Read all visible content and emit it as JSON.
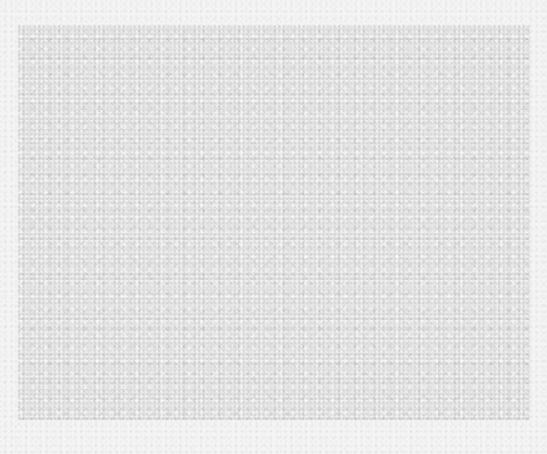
{
  "canvas": {
    "background_color": "#f4f4f4",
    "panel_color": "#e4e4e4",
    "description": "noisy gray textured rectangle on light speckled background; no text or UI content visible"
  }
}
